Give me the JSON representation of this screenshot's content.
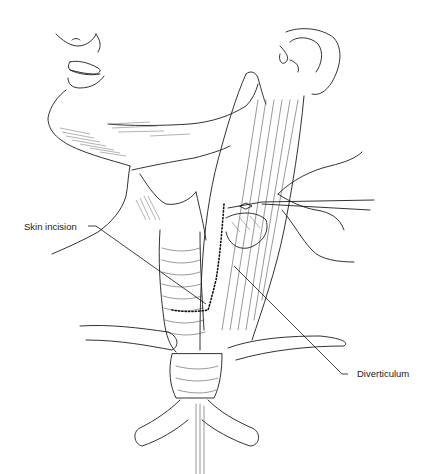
{
  "figure": {
    "labels": [
      {
        "id": "skin-incision",
        "text": "Skin incision"
      },
      {
        "id": "diverticulum",
        "text": "Diverticulum"
      }
    ],
    "colors": {
      "background": "#ffffff",
      "ink": "#1c1c1c"
    }
  }
}
